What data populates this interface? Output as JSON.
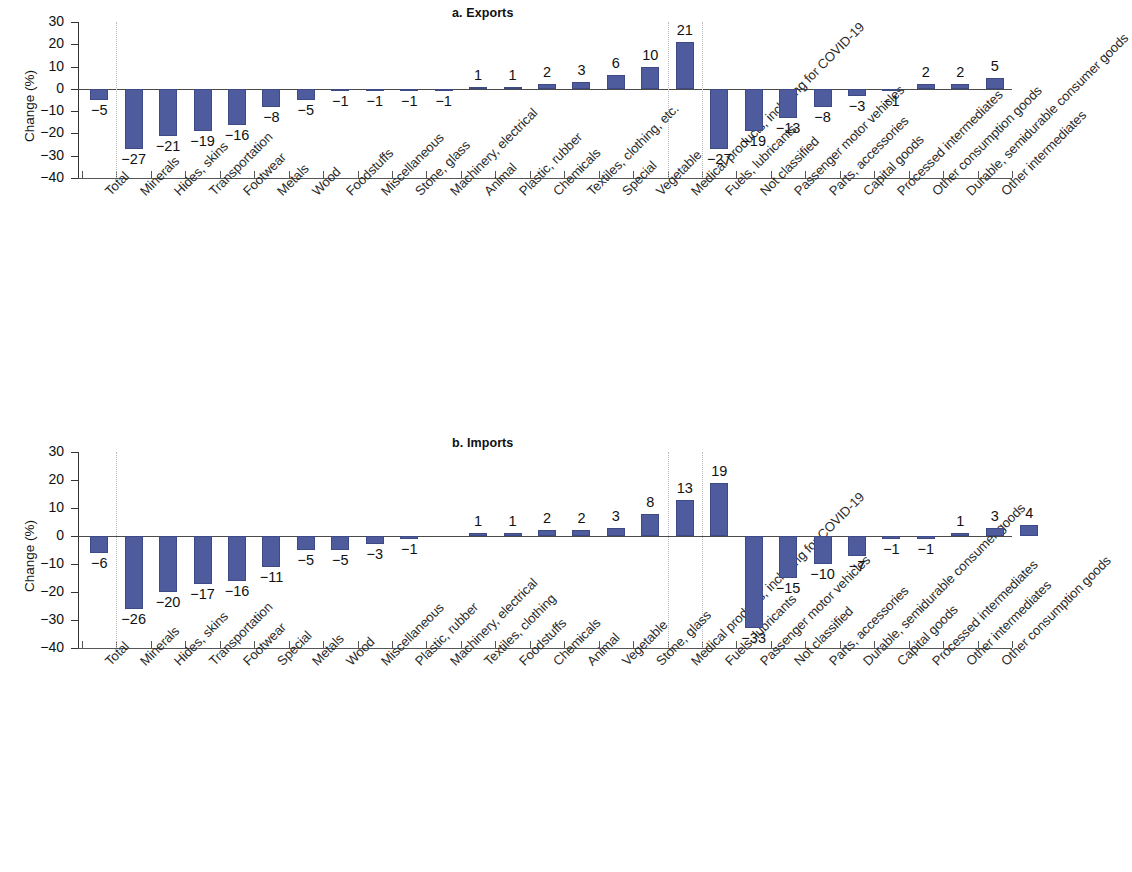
{
  "figure": {
    "axis_label": "Change (%)",
    "y_ticks": [
      "30",
      "20",
      "10",
      "0",
      "-10",
      "-20",
      "-30",
      "-40"
    ]
  },
  "chart_data": [
    {
      "type": "bar",
      "title": "a. Exports",
      "xlabel": "",
      "ylabel": "Change (%)",
      "ylim": [
        -40,
        30
      ],
      "grid": false,
      "legend": "none",
      "group_separators": [
        1,
        17,
        18
      ],
      "categories": [
        "Total",
        "Minerals",
        "Hides, skins",
        "Transportation",
        "Footwear",
        "Metals",
        "Wood",
        "Foodstuffs",
        "Miscellaneous",
        "Stone, glass",
        "Machinery, electrical",
        "Animal",
        "Plastic, rubber",
        "Chemicals",
        "Textiles, clothing, etc.",
        "Special",
        "Vegetable",
        "Medical products, including for COVID-19",
        "Fuels, lubricants",
        "Not classified",
        "Passenger motor vehicles",
        "Parts, accessories",
        "Capital goods",
        "Processed intermediates",
        "Other consumption goods",
        "Durable, semidurable consumer goods",
        "Other intermediates"
      ],
      "values": [
        -5,
        -27,
        -21,
        -19,
        -16,
        -8,
        -5,
        -1,
        -1,
        -1,
        -1,
        1,
        1,
        2,
        3,
        6,
        10,
        21,
        -27,
        -19,
        -13,
        -8,
        -3,
        -1,
        2,
        2,
        5
      ],
      "labels": [
        "-5",
        "-27",
        "-21",
        "-19",
        "-16",
        "-8",
        "-5",
        "-1",
        "-1",
        "-1",
        "-1",
        "1",
        "1",
        "2",
        "3",
        "6",
        "10",
        "21",
        "-27",
        "-19",
        "-13",
        "-8",
        "-3",
        "-1",
        "2",
        "2",
        "5"
      ]
    },
    {
      "type": "bar",
      "title": "b. Imports",
      "xlabel": "",
      "ylabel": "Change (%)",
      "ylim": [
        -40,
        30
      ],
      "grid": false,
      "legend": "none",
      "group_separators": [
        1,
        17,
        18
      ],
      "categories": [
        "Total",
        "Minerals",
        "Hides, skins",
        "Transportation",
        "Footwear",
        "Special",
        "Metals",
        "Wood",
        "Miscellaneous",
        "Plastic, rubber",
        "Machinery, electrical",
        "Textiles, clothing",
        "Foodstuffs",
        "Chemicals",
        "Animal",
        "Vegetable",
        "Stone, glass",
        "Medical products, including for COVID-19",
        "Fuels, lubricants",
        "Passenger motor vehicles",
        "Not classified",
        "Parts, accessories",
        "Durable, semidurable consumer goods",
        "Capital goods",
        "Processed intermediates",
        "Other intermediates",
        "Other consumption goods"
      ],
      "values": [
        -6,
        -26,
        -20,
        -17,
        -16,
        -11,
        -5,
        -5,
        -3,
        -1,
        0,
        1,
        1,
        2,
        2,
        3,
        8,
        13,
        19,
        -33,
        -15,
        -10,
        -7,
        -1,
        -1,
        1,
        3,
        4
      ],
      "labels": [
        "-6",
        "-26",
        "-20",
        "-17",
        "-16",
        "-11",
        "-5",
        "-5",
        "-3",
        "-1",
        "",
        "1",
        "1",
        "2",
        "2",
        "3",
        "8",
        "13",
        "19",
        "-33",
        "-15",
        "-10",
        "-7",
        "-1",
        "-1",
        "1",
        "3",
        "4"
      ]
    }
  ],
  "colors": {
    "bar": "#4e5c9e",
    "axis": "#4a4a4a",
    "separator": "#b9b9b9",
    "text": "#1a1a1a"
  }
}
